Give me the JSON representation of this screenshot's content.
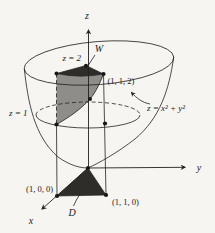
{
  "figure": {
    "colors": {
      "background": "#f6f5f1",
      "line": "#23211f",
      "dark_region": "#2f2d2a",
      "gray_region": "#8f8d8a"
    },
    "labels": {
      "z_axis": "z",
      "y_axis": "y",
      "x_axis": "x",
      "plane_top": "z = 2",
      "plane_mid": "z = 1",
      "surface_equation": "z = x² + y²",
      "solid_region": "W",
      "base_region": "D",
      "point_1_1_2": "(1, 1, 2)",
      "point_1_0_0": "(1, 0, 0)",
      "point_1_1_0": "(1, 1, 0)"
    }
  }
}
